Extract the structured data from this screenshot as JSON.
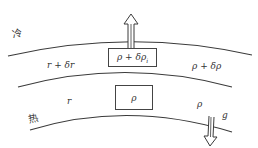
{
  "diagram": {
    "labels": {
      "cold": "冷",
      "hot": "热",
      "upper_r": "r + δr",
      "lower_r": "r",
      "upper_rho": "ρ + δρ",
      "lower_rho": "ρ",
      "gravity": "g"
    },
    "parcels": {
      "upper": {
        "text": "ρ + δρ",
        "subscript": "i"
      },
      "lower": {
        "text": "ρ"
      }
    },
    "arrows": {
      "buoyancy": "up",
      "gravity": "down"
    },
    "colors": {
      "line": "#3a3a3a",
      "text": "#333333",
      "background": "#ffffff"
    }
  }
}
